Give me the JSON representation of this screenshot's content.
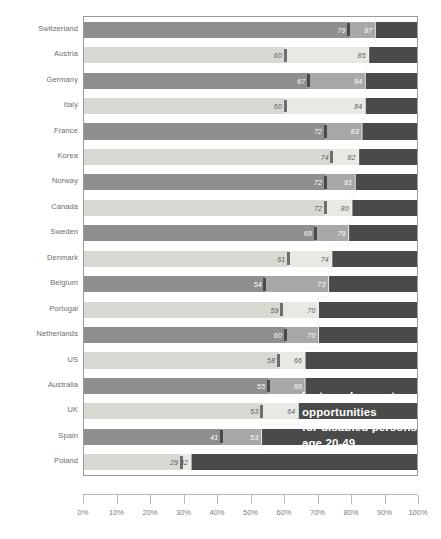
{
  "chart_data": {
    "type": "bar",
    "title": "",
    "subtitle": "",
    "xlabel": "",
    "ylabel": "",
    "xlim": [
      0,
      100
    ],
    "grid": false,
    "legend_position": "none",
    "orientation": "horizontal",
    "annotation": {
      "lines": [
        "lost employment",
        "opportunities",
        "for disabled persons",
        "age 20-49"
      ]
    },
    "categories": [
      "Switzerland",
      "Austria",
      "Germany",
      "Italy",
      "France",
      "Korea",
      "Norway",
      "Canada",
      "Sweden",
      "Denmark",
      "Belgium",
      "Portugal",
      "Netherlands",
      "US",
      "Australia",
      "UK",
      "Spain",
      "Poland"
    ],
    "series": [
      {
        "name": "disabled employment rate",
        "values": [
          79,
          60,
          67,
          60,
          72,
          74,
          72,
          72,
          69,
          61,
          54,
          59,
          60,
          58,
          55,
          53,
          41,
          29
        ]
      },
      {
        "name": "non-disabled employment rate",
        "values": [
          87,
          85,
          84,
          84,
          83,
          82,
          81,
          80,
          79,
          74,
          73,
          70,
          70,
          66,
          66,
          64,
          53,
          32
        ]
      }
    ],
    "xticks": [
      "0%",
      "10%",
      "20%",
      "30%",
      "40%",
      "50%",
      "60%",
      "70%",
      "80%",
      "90%",
      "100%"
    ],
    "xtick_values": [
      0,
      10,
      20,
      30,
      40,
      50,
      60,
      70,
      80,
      90,
      100
    ],
    "colors": {
      "bar_remainder": "#4a4a4a",
      "bar_light": "#a8a8a8",
      "bar_mid": "#8f8f8f",
      "bar_light_alt": "#e9e9e4",
      "bar_mid_alt": "#d9d9d4",
      "marker": "#4a4a4a",
      "label_text": "#6d6d6d",
      "annotation_text": "#ffffff",
      "axis": "#b9b9b9"
    }
  }
}
